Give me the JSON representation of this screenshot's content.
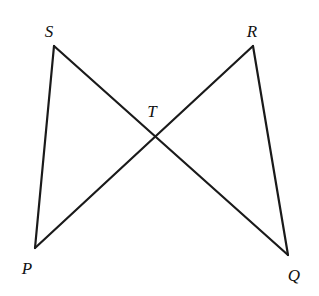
{
  "figure": {
    "canvas": {
      "width": 319,
      "height": 296
    },
    "background_color": "#ffffff",
    "stroke_color": "#1a1a1a",
    "stroke_width": 2.2,
    "label_color": "#111111",
    "points": {
      "S": {
        "name": "S",
        "x": 54,
        "y": 46,
        "label_x": 49,
        "label_y": 31
      },
      "R": {
        "name": "R",
        "x": 253,
        "y": 46,
        "label_x": 252,
        "label_y": 31
      },
      "P": {
        "name": "P",
        "x": 35,
        "y": 248,
        "label_x": 27,
        "label_y": 268
      },
      "Q": {
        "name": "Q",
        "x": 288,
        "y": 255,
        "label_x": 294,
        "label_y": 275
      },
      "T": {
        "name": "T",
        "x": 157,
        "y": 140,
        "label_x": 152,
        "label_y": 111
      }
    },
    "segments": [
      {
        "name": "segment-SP",
        "from": "S",
        "to": "P"
      },
      {
        "name": "segment-SQ",
        "from": "S",
        "to": "Q"
      },
      {
        "name": "segment-RP",
        "from": "R",
        "to": "P"
      },
      {
        "name": "segment-RQ",
        "from": "R",
        "to": "Q"
      }
    ],
    "labels": [
      "S",
      "R",
      "T",
      "P",
      "Q"
    ]
  }
}
